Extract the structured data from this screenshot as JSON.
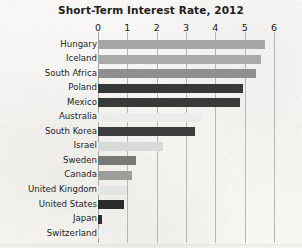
{
  "chart_data": {
    "type": "bar",
    "orientation": "horizontal",
    "title": "Short-Term Interest Rate, 2012",
    "xlabel": "",
    "ylabel": "",
    "xlim": [
      0,
      6
    ],
    "xticks": [
      0,
      1,
      2,
      3,
      4,
      5,
      6
    ],
    "xtick_labels": [
      "0",
      "1",
      "2",
      "3",
      "4",
      "5",
      "6"
    ],
    "grid": true,
    "legend": false,
    "categories": [
      "Hungary",
      "Iceland",
      "South Africa",
      "Poland",
      "Mexico",
      "Australia",
      "South Korea",
      "Israel",
      "Sweden",
      "Canada",
      "United Kingdom",
      "United States",
      "Japan",
      "Switzerland"
    ],
    "values": [
      5.7,
      5.55,
      5.4,
      4.95,
      4.85,
      3.5,
      3.3,
      2.2,
      1.3,
      1.15,
      1.0,
      0.9,
      0.12,
      0.03
    ],
    "bar_colors": [
      "#a6a6a4",
      "#aaaaa8",
      "#8f8f8d",
      "#373737",
      "#393939",
      "#ececea",
      "#3d3d3d",
      "#d9d9d7",
      "#787876",
      "#9d9d9b",
      "#e4e4e2",
      "#2b2b2b",
      "#2e2e2e",
      "#d3d3d1"
    ]
  },
  "axis": {
    "tick_color": "#17181a",
    "gridline_color": "#b6b6b2"
  },
  "figure": {
    "background_color": "#f6f5f2",
    "title_color": "#1d1d1d"
  }
}
